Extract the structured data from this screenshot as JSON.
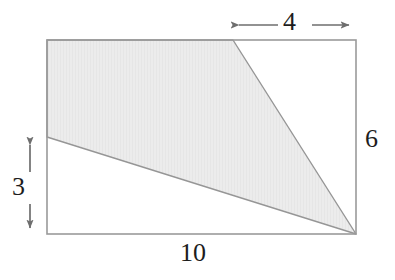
{
  "figure": {
    "type": "geometry-diagram",
    "colors": {
      "shade_fill": "#ebebeb",
      "shade_stroke": "#969696",
      "rectangle_stroke": "#9a9a9a",
      "arrow_stroke": "#6e6e6e",
      "label_text": "#1d1d1d",
      "background": "#ffffff"
    },
    "rectangle": {
      "width_label": "10",
      "height_label": "6",
      "pixels": {
        "left": 47,
        "top": 40,
        "right": 356,
        "bottom": 234
      }
    },
    "dimensions": [
      {
        "name": "top-segment",
        "label": "4",
        "orientation": "horizontal",
        "position": "above-top-edge",
        "from_px": 232,
        "to_px": 356,
        "y_px": 25
      },
      {
        "name": "right-side",
        "label": "6",
        "orientation": "vertical",
        "position": "right-of-rectangle"
      },
      {
        "name": "left-segment",
        "label": "3",
        "orientation": "vertical",
        "position": "left-of-rectangle",
        "from_px": 138,
        "to_px": 234,
        "x_px": 30
      },
      {
        "name": "bottom-side",
        "label": "10",
        "orientation": "horizontal",
        "position": "below-bottom-edge"
      }
    ],
    "shaded_region": {
      "description": "quadrilateral with vertices at top-left corner, point on top edge 4 from right, bottom-right corner, and point on left edge 3 up from bottom",
      "vertices_units": [
        [
          0,
          6
        ],
        [
          6,
          6
        ],
        [
          10,
          0
        ],
        [
          0,
          3
        ]
      ],
      "vertices_px": [
        [
          47,
          40
        ],
        [
          233,
          40
        ],
        [
          356,
          234
        ],
        [
          47,
          137
        ]
      ]
    }
  }
}
